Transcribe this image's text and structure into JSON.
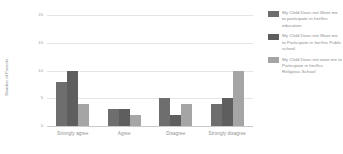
{
  "chart_data": {
    "type": "bar",
    "title": "",
    "xlabel": "",
    "ylabel": "Number of Parents",
    "ylim": [
      0,
      20
    ],
    "yticks": [
      0,
      5,
      10,
      15,
      20
    ],
    "grid": true,
    "legend_position": "right",
    "categories": [
      "Strongly agree",
      "Agree",
      "Disagree",
      "Strongly disagree"
    ],
    "series": [
      {
        "name": "My Child Does not Want me to participate in her/his education",
        "color": "#6e6e6e",
        "values": [
          8,
          3,
          5,
          4
        ]
      },
      {
        "name": "My Child Does not Want me to Participate in her/his Public school",
        "color": "#5e5e5e",
        "values": [
          10,
          3,
          2,
          5
        ]
      },
      {
        "name": "My Child Does not want me to Participate in her/his Religious School",
        "color": "#a5a5a5",
        "values": [
          4,
          2,
          4,
          10
        ]
      }
    ]
  }
}
